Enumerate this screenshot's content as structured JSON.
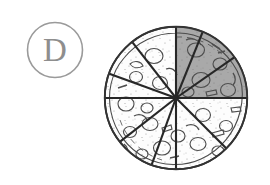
{
  "question_option": {
    "letter": "D",
    "badge_icon": "circle-outline-icon",
    "badge_stroke_color": "#9a9a9a",
    "letter_color": "#8e8e8e"
  },
  "figure": {
    "name": "pizza-fraction-diagram",
    "total_slices": 11,
    "shaded_slices": 3,
    "shaded_fraction": "3/11",
    "shaded_region": "upper-right quadrant",
    "crust_color": "#3a3a3a",
    "shaded_fill_color": "#a8a8a8",
    "unshaded_fill_color": "#fdfdfd",
    "cut_line_color": "#2b2b2b",
    "topping_outline_color": "#555555",
    "center": {
      "x": 76,
      "y": 78
    },
    "radius": 72,
    "cut_angles_deg": [
      0,
      35,
      68,
      90,
      128,
      160,
      180,
      218,
      250,
      270,
      315
    ],
    "shaded_angle_range_deg": [
      0,
      90
    ]
  }
}
